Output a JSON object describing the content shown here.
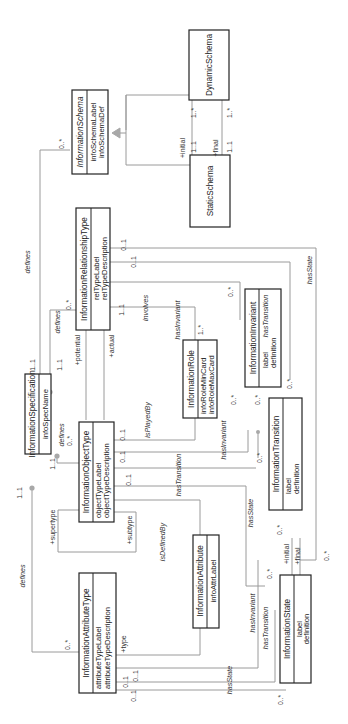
{
  "diagram": {
    "classes": {
      "dynamic_schema": {
        "name": "DynamicSchema",
        "attributes": []
      },
      "static_schema": {
        "name": "StaticSchema",
        "attributes": []
      },
      "information_schema": {
        "name": "InformationSchema",
        "abstract": true,
        "attributes": [
          "infoSchemaLabel",
          "infoSchemaDef"
        ]
      },
      "information_relationship_type": {
        "name": "InformationRelationshipType",
        "attributes": [
          "relTypeLabel",
          "relTypeDescription"
        ]
      },
      "information_specification": {
        "name": "InformationSpecification",
        "attributes": [
          "infoSpecName"
        ]
      },
      "information_object_type": {
        "name": "InformationObjectType",
        "attributes": [
          "objectTypeLabel",
          "objectTypeDescription"
        ]
      },
      "information_role": {
        "name": "InformationRole",
        "attributes": [
          "infoRoleMinCard",
          "infoRoleMaxCard"
        ]
      },
      "information_invariant": {
        "name": "InformationInvariant",
        "attributes": [
          "label",
          "definition"
        ]
      },
      "information_transition": {
        "name": "InformationTransition",
        "attributes": [
          "label",
          "definition"
        ]
      },
      "information_attribute": {
        "name": "InformationAttribute",
        "attributes": [
          "infoAttrLabel"
        ]
      },
      "information_attribute_type": {
        "name": "InformationAttributeType",
        "attributes": [
          "attributeTypeLabel",
          "attributeTypeDescription"
        ]
      },
      "information_state": {
        "name": "InformationState",
        "attributes": [
          "label",
          "definition"
        ]
      }
    },
    "labels": {
      "defines": "defines",
      "involves": "involves",
      "has_invariant": "hasInvariant",
      "has_transition": "hasTransition",
      "has_state": "hasState",
      "is_played_by": "isPlayedBy",
      "is_defined_by": "isDefinedBy"
    },
    "roles": {
      "initial": "+initial",
      "final": "+final",
      "potential": "+potential",
      "actual": "+actual",
      "supertype": "+supertype",
      "subtype": "+subtype",
      "type": "+type"
    },
    "multiplicities": {
      "one_one": "1..1",
      "one_many": "1..*",
      "zero_many": "0..*",
      "zero_one": "0..1"
    }
  }
}
